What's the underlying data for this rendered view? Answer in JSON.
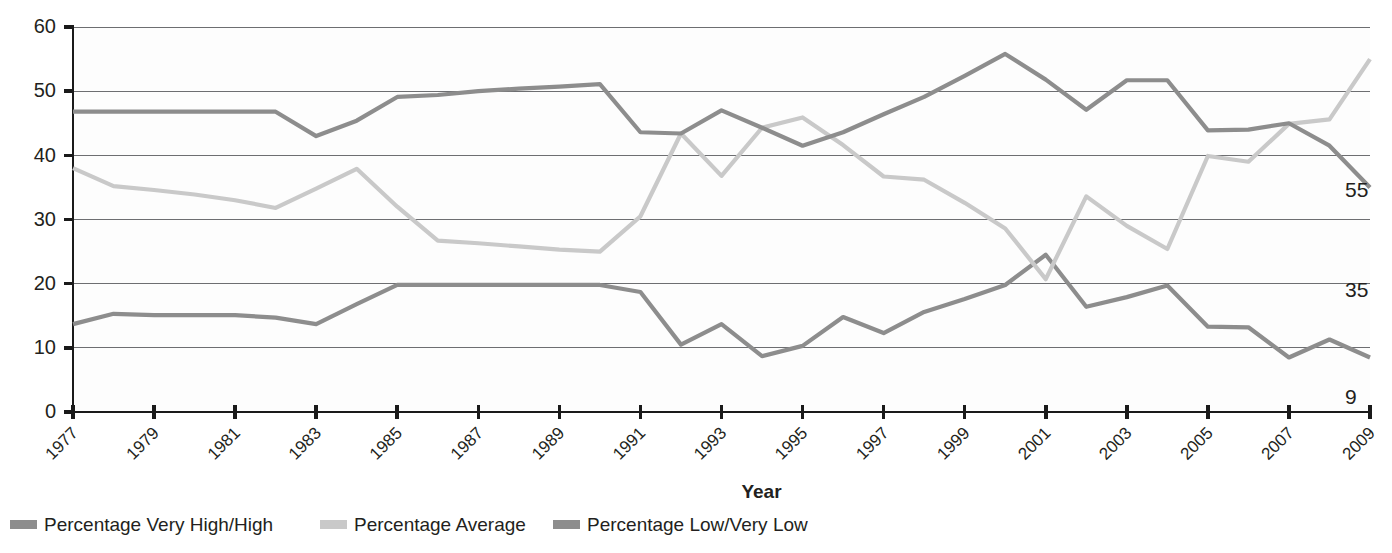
{
  "chart_data": {
    "type": "line",
    "title": "",
    "xlabel": "Year",
    "ylabel": "",
    "xlim": [
      1977,
      2009
    ],
    "ylim": [
      0,
      60
    ],
    "ytick_step": 10,
    "grid": true,
    "legend_position": "bottom-left",
    "x": [
      1977,
      1978,
      1979,
      1980,
      1981,
      1982,
      1983,
      1984,
      1985,
      1986,
      1987,
      1988,
      1989,
      1990,
      1991,
      1992,
      1993,
      1994,
      1995,
      1996,
      1997,
      1998,
      1999,
      2000,
      2001,
      2002,
      2003,
      2004,
      2005,
      2006,
      2007,
      2008,
      2009
    ],
    "xtick_labels": [
      "1977",
      "1979",
      "1981",
      "1983",
      "1985",
      "1987",
      "1989",
      "1991",
      "1993",
      "1995",
      "1997",
      "1999",
      "2001",
      "2003",
      "2005",
      "2007",
      "2009"
    ],
    "ytick_labels": [
      "0",
      "10",
      "20",
      "30",
      "40",
      "50",
      "60"
    ],
    "series": [
      {
        "name": "Percentage Very High/High",
        "color": "#8d8d8d",
        "end_label": "9",
        "values": [
          13.7,
          15.3,
          15.1,
          15.1,
          15.1,
          14.7,
          13.7,
          16.8,
          19.8,
          19.8,
          19.8,
          19.8,
          19.8,
          19.8,
          18.7,
          10.5,
          13.7,
          8.7,
          10.3,
          14.8,
          12.3,
          15.6,
          17.6,
          19.8,
          24.5,
          16.4,
          17.9,
          19.7,
          13.3,
          13.2,
          8.5,
          11.3,
          8.5
        ]
      },
      {
        "name": "Percentage Average",
        "color": "#c9c9c9",
        "end_label": "35",
        "values": [
          38.0,
          35.2,
          34.6,
          33.9,
          33.0,
          31.8,
          34.8,
          37.9,
          32.0,
          26.7,
          26.3,
          25.8,
          25.3,
          25.0,
          30.5,
          43.4,
          36.8,
          44.3,
          45.9,
          41.6,
          36.7,
          36.2,
          32.6,
          28.6,
          20.7,
          33.6,
          29.0,
          25.4,
          39.9,
          39.0,
          44.9,
          45.6,
          55.0
        ]
      },
      {
        "name": "Percentage Low/Very Low",
        "color": "#8d8d8d",
        "end_label": "55",
        "values": [
          46.8,
          46.8,
          46.8,
          46.8,
          46.8,
          46.8,
          43.0,
          45.4,
          49.1,
          49.4,
          50.0,
          50.4,
          50.7,
          51.1,
          43.6,
          43.4,
          47.0,
          44.3,
          41.5,
          43.6,
          46.4,
          49.1,
          52.4,
          55.8,
          51.8,
          47.1,
          51.7,
          51.7,
          43.9,
          44.0,
          45.0,
          41.5,
          35.0
        ]
      }
    ]
  },
  "axis": {
    "x_title": "Year"
  },
  "legend": {
    "items": [
      {
        "label": "Percentage Very High/High",
        "color": "#8d8d8d"
      },
      {
        "label": "Percentage Average",
        "color": "#c9c9c9"
      },
      {
        "label": "Percentage Low/Very Low",
        "color": "#8d8d8d"
      }
    ]
  }
}
